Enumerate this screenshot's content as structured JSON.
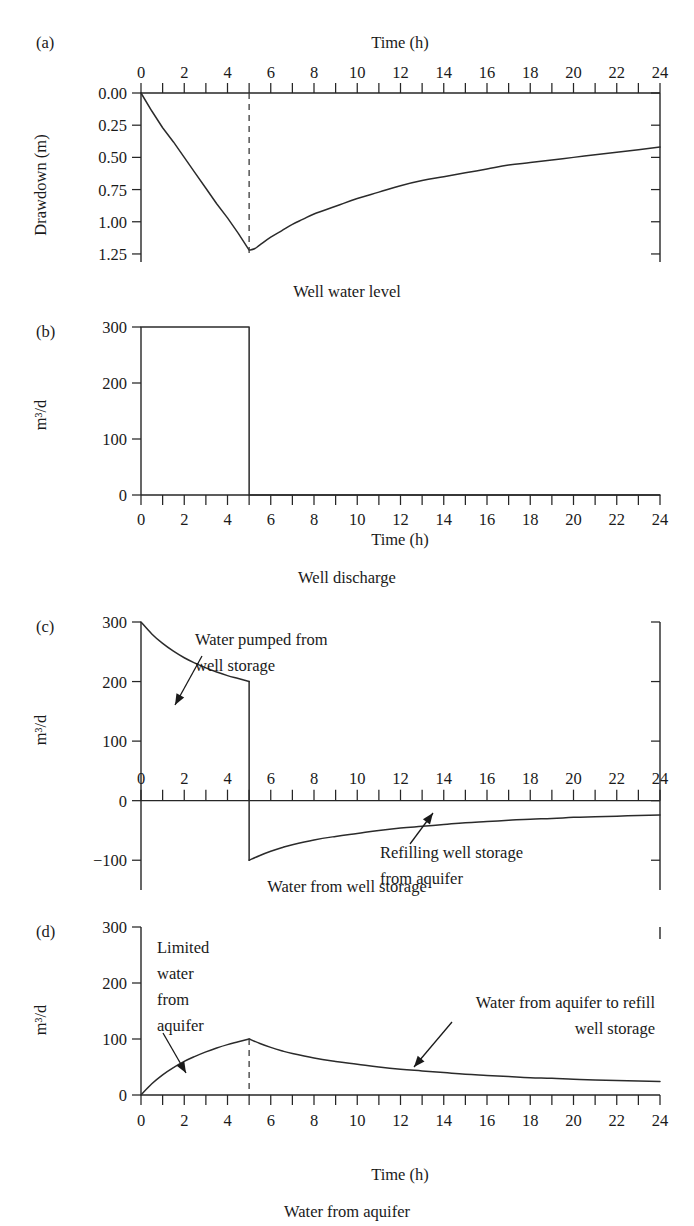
{
  "figure": {
    "panels": [
      {
        "label": "(a)",
        "caption": "Well water level",
        "ylabel": "Drawdown (m)",
        "xlabel_top": "Time (h)",
        "xlabel_bottom": ""
      },
      {
        "label": "(b)",
        "caption": "Well discharge",
        "ylabel": "m³/d",
        "xlabel_top": "",
        "xlabel_bottom": "Time (h)"
      },
      {
        "label": "(c)",
        "caption": "Water from well storage",
        "ylabel": "m³/d",
        "xlabel_top": "",
        "xlabel_bottom": ""
      },
      {
        "label": "(d)",
        "caption": "Water from aquifer",
        "ylabel": "m³/d",
        "xlabel_top": "",
        "xlabel_bottom": "Time (h)"
      }
    ]
  },
  "chart_data": [
    {
      "type": "line",
      "panel": "a",
      "title": "Well water level",
      "xlabel": "Time (h)",
      "ylabel": "Drawdown (m)",
      "xlim": [
        0,
        24
      ],
      "ylim": [
        0.0,
        1.3125
      ],
      "y_inverted": true,
      "xticks": [
        0,
        1,
        2,
        3,
        4,
        5,
        6,
        7,
        8,
        9,
        10,
        11,
        12,
        13,
        14,
        15,
        16,
        17,
        18,
        19,
        20,
        21,
        22,
        23,
        24
      ],
      "xticklabels": [
        "0",
        "",
        "2",
        "",
        "4",
        "",
        "6",
        "",
        "8",
        "",
        "10",
        "",
        "12",
        "",
        "14",
        "",
        "16",
        "",
        "18",
        "",
        "20",
        "",
        "22",
        "",
        "24"
      ],
      "yticks": [
        0.0,
        0.25,
        0.5,
        0.75,
        1.0,
        1.25
      ],
      "yticklabels": [
        "0.00",
        "0.25",
        "0.50",
        "0.75",
        "1.00",
        "1.25"
      ],
      "grid": false,
      "x_axis_position": "top",
      "vertical_marker_x": 5,
      "series": [
        {
          "name": "Drawdown",
          "x": [
            0,
            0.5,
            1,
            1.5,
            2,
            2.5,
            3,
            3.5,
            4,
            4.5,
            5,
            5.25,
            5.5,
            6,
            6.5,
            7,
            7.5,
            8,
            9,
            10,
            11,
            12,
            13,
            14,
            15,
            16,
            17,
            18,
            19,
            20,
            21,
            22,
            23,
            24
          ],
          "values": [
            0.0,
            0.14,
            0.27,
            0.38,
            0.5,
            0.62,
            0.74,
            0.86,
            0.97,
            1.09,
            1.22,
            1.21,
            1.18,
            1.12,
            1.07,
            1.02,
            0.98,
            0.94,
            0.88,
            0.82,
            0.77,
            0.72,
            0.68,
            0.65,
            0.62,
            0.59,
            0.56,
            0.54,
            0.52,
            0.5,
            0.48,
            0.46,
            0.44,
            0.42
          ]
        }
      ]
    },
    {
      "type": "line",
      "panel": "b",
      "title": "Well discharge",
      "xlabel": "Time (h)",
      "ylabel": "m³/d",
      "xlim": [
        0,
        24
      ],
      "ylim": [
        0,
        300
      ],
      "xticks": [
        0,
        1,
        2,
        3,
        4,
        5,
        6,
        7,
        8,
        9,
        10,
        11,
        12,
        13,
        14,
        15,
        16,
        17,
        18,
        19,
        20,
        21,
        22,
        23,
        24
      ],
      "xticklabels": [
        "0",
        "",
        "2",
        "",
        "4",
        "",
        "6",
        "",
        "8",
        "",
        "10",
        "",
        "12",
        "",
        "14",
        "",
        "16",
        "",
        "18",
        "",
        "20",
        "",
        "22",
        "",
        "24"
      ],
      "yticks": [
        0,
        100,
        200,
        300
      ],
      "yticklabels": [
        "0",
        "100",
        "200",
        "300"
      ],
      "grid": false,
      "series": [
        {
          "name": "Well discharge",
          "x": [
            0,
            5,
            5,
            24
          ],
          "values": [
            300,
            300,
            0,
            0
          ]
        }
      ]
    },
    {
      "type": "line",
      "panel": "c",
      "title": "Water from well storage",
      "xlabel": "Time (h)",
      "ylabel": "m³/d",
      "xlim": [
        0,
        24
      ],
      "ylim": [
        -150,
        300
      ],
      "xticks": [
        0,
        1,
        2,
        3,
        4,
        5,
        6,
        7,
        8,
        9,
        10,
        11,
        12,
        13,
        14,
        15,
        16,
        17,
        18,
        19,
        20,
        21,
        22,
        23,
        24
      ],
      "xticklabels": [
        "0",
        "",
        "2",
        "",
        "4",
        "",
        "6",
        "",
        "8",
        "",
        "10",
        "",
        "12",
        "",
        "14",
        "",
        "16",
        "",
        "18",
        "",
        "20",
        "",
        "22",
        "",
        "24"
      ],
      "yticks": [
        -100,
        0,
        100,
        200,
        300
      ],
      "yticklabels": [
        "−100",
        "0",
        "100",
        "200",
        "300"
      ],
      "grid": false,
      "x_axis_position": "zero",
      "annotations": [
        {
          "text": "Water pumped from\nwell storage",
          "align": "left",
          "target_x": 3.1,
          "target_y": 190
        },
        {
          "text": "Refilling well storage\nfrom aquifer",
          "align": "left",
          "target_x": 12.4,
          "target_y": -40
        }
      ],
      "series": [
        {
          "name": "Water from well storage",
          "x": [
            0,
            0.5,
            1,
            1.5,
            2,
            2.5,
            3,
            3.5,
            4,
            4.5,
            5,
            5,
            5.5,
            6,
            6.5,
            7,
            8,
            9,
            10,
            11,
            12,
            13,
            14,
            15,
            16,
            17,
            18,
            19,
            20,
            21,
            22,
            23,
            24
          ],
          "values": [
            300,
            280,
            264,
            251,
            240,
            231,
            223,
            216,
            210,
            205,
            200,
            -100,
            -92,
            -85,
            -79,
            -74,
            -66,
            -60,
            -55,
            -50,
            -46,
            -43,
            -40,
            -37,
            -35,
            -33,
            -31,
            -30,
            -28,
            -27,
            -26,
            -25,
            -24
          ]
        }
      ]
    },
    {
      "type": "line",
      "panel": "d",
      "title": "Water from aquifer",
      "xlabel": "Time (h)",
      "ylabel": "m³/d",
      "xlim": [
        0,
        24
      ],
      "ylim": [
        0,
        300
      ],
      "xticks": [
        0,
        1,
        2,
        3,
        4,
        5,
        6,
        7,
        8,
        9,
        10,
        11,
        12,
        13,
        14,
        15,
        16,
        17,
        18,
        19,
        20,
        21,
        22,
        23,
        24
      ],
      "xticklabels": [
        "0",
        "",
        "2",
        "",
        "4",
        "",
        "6",
        "",
        "8",
        "",
        "10",
        "",
        "12",
        "",
        "14",
        "",
        "16",
        "",
        "18",
        "",
        "20",
        "",
        "22",
        "",
        "24"
      ],
      "yticks": [
        0,
        100,
        200,
        300
      ],
      "yticklabels": [
        "0",
        "100",
        "200",
        "300"
      ],
      "grid": false,
      "vertical_marker_x": 5,
      "annotations": [
        {
          "text": "Limited\nwater\nfrom\naquifer",
          "align": "left",
          "target_x": 2.7,
          "target_y": 48
        },
        {
          "text": "Water from aquifer to refill\nwell storage",
          "align": "right",
          "target_x": 12.2,
          "target_y": 30
        }
      ],
      "series": [
        {
          "name": "Water from aquifer",
          "x": [
            0,
            0.5,
            1,
            1.5,
            2,
            2.5,
            3,
            3.5,
            4,
            4.5,
            5,
            5.5,
            6,
            6.5,
            7,
            8,
            9,
            10,
            11,
            12,
            13,
            14,
            15,
            16,
            17,
            18,
            19,
            20,
            21,
            22,
            23,
            24
          ],
          "values": [
            0,
            20,
            36,
            49,
            60,
            69,
            77,
            84,
            90,
            95,
            100,
            92,
            85,
            79,
            74,
            66,
            60,
            55,
            50,
            46,
            43,
            40,
            37,
            35,
            33,
            31,
            30,
            28,
            27,
            26,
            25,
            24
          ]
        }
      ]
    }
  ]
}
